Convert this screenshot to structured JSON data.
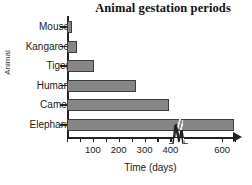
{
  "chart_data": {
    "type": "bar",
    "orientation": "horizontal",
    "title": "Animal gestation periods",
    "xlabel": "Time (days)",
    "ylabel": "Animal",
    "categories": [
      "Mouse",
      "Kangaroo",
      "Tiger",
      "Human",
      "Camel",
      "Elephant"
    ],
    "values": [
      20,
      40,
      105,
      265,
      395,
      645
    ],
    "units": "days",
    "xlim": [
      0,
      700
    ],
    "xticks": [
      0,
      50,
      100,
      150,
      200,
      250,
      300,
      350,
      400,
      600,
      650
    ],
    "xtick_labels": [
      "",
      "",
      "100",
      "",
      "200",
      "",
      "300",
      "",
      "400",
      "600",
      ""
    ],
    "grid": false,
    "legend": false,
    "axis_break": {
      "present": true,
      "axis": "x",
      "at": 430,
      "symbol": "zigzag"
    },
    "bar_color": "#868686",
    "bar_edge_color": "#3d3d3d",
    "axis_color": "#222222"
  },
  "axis": {
    "arrow_right": "arrowhead"
  }
}
